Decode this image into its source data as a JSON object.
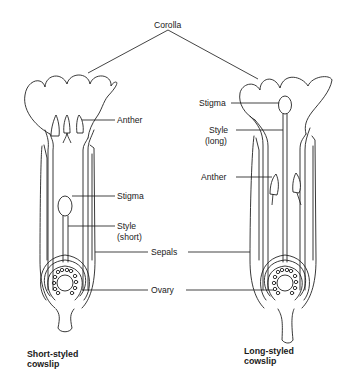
{
  "diagram": {
    "labels": {
      "corolla": "Corolla",
      "left": {
        "anther": "Anther",
        "stigma": "Stigma",
        "style_line1": "Style",
        "style_line2": "(short)"
      },
      "right": {
        "stigma": "Stigma",
        "style_line1": "Style",
        "style_line2": "(long)",
        "anther": "Anther"
      },
      "sepals": "Sepals",
      "ovary": "Ovary"
    },
    "captions": {
      "left_line1": "Short-styled",
      "left_line2": "cowslip",
      "right_line1": "Long-styled",
      "right_line2": "cowslip"
    },
    "colors": {
      "line": "#222222",
      "background": "#ffffff"
    }
  }
}
